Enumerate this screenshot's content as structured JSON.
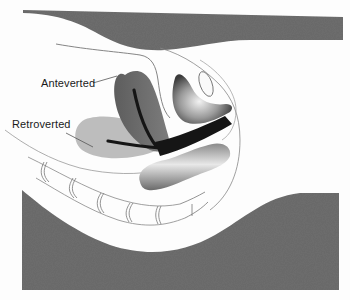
{
  "diagram": {
    "labels": {
      "anteverted": "Anteverted",
      "retroverted": "Retroverted"
    },
    "structures": [
      {
        "name": "anteverted-uterus",
        "shade": "dark gray"
      },
      {
        "name": "retroverted-uterus",
        "shade": "light gray"
      },
      {
        "name": "vaginal-canal",
        "shade": "black"
      },
      {
        "name": "bladder",
        "shade": "white/gray shaded"
      },
      {
        "name": "pubic-bone",
        "shade": "outline"
      },
      {
        "name": "rectum",
        "shade": "gray shaded"
      },
      {
        "name": "spine-sacrum",
        "shade": "outline"
      },
      {
        "name": "body-surface-top",
        "shade": "dark gray"
      },
      {
        "name": "body-surface-bottom",
        "shade": "dark gray"
      }
    ],
    "colors": {
      "background": "#fdfdfd",
      "body_band": "#6e6e6e",
      "anteverted_uterus": "#6a6a6a",
      "retroverted_uterus": "#bdbdbd",
      "canal": "#151515",
      "outline": "#7a7a7a",
      "text": "#1a1a1a"
    }
  }
}
